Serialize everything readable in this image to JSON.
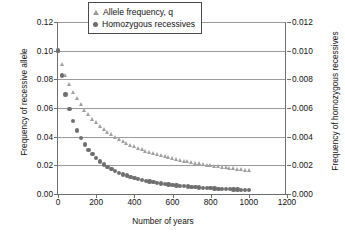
{
  "chart_data": {
    "type": "scatter",
    "title": "",
    "xlabel": "Number of years",
    "ylabel": "Frequency of recessive allele",
    "ylabel_right": "Frequency of homozygous recessives",
    "xlim": [
      0,
      1200
    ],
    "ylim": [
      0,
      0.12
    ],
    "ylim_right": [
      0,
      0.012
    ],
    "xticks": [
      0,
      200,
      400,
      600,
      800,
      1000,
      1200
    ],
    "xticklabels": [
      "0",
      "200",
      "400",
      "600",
      "800",
      "1000",
      "1200"
    ],
    "yticks": [
      0.0,
      0.02,
      0.04,
      0.06,
      0.08,
      0.1,
      0.12
    ],
    "yticklabels": [
      "0.00",
      "0.02",
      "0.04",
      "0.06",
      "0.08",
      "0.10",
      "0.12"
    ],
    "yticks_right": [
      0.0,
      0.002,
      0.004,
      0.006,
      0.008,
      0.01,
      0.012
    ],
    "yticklabels_right": [
      "0.000",
      "0.002",
      "0.004",
      "0.006",
      "0.008",
      "0.010",
      "0.012"
    ],
    "grid": true,
    "legend_position": "top-center",
    "series": [
      {
        "name": "Allele frequency, q",
        "marker": "triangle",
        "color": "#a0a0a0",
        "axis": "left",
        "x": [
          0,
          20,
          40,
          60,
          80,
          100,
          120,
          140,
          160,
          180,
          200,
          220,
          240,
          260,
          280,
          300,
          320,
          340,
          360,
          380,
          400,
          420,
          440,
          460,
          480,
          500,
          520,
          540,
          560,
          580,
          600,
          620,
          640,
          660,
          680,
          700,
          720,
          740,
          760,
          780,
          800,
          820,
          840,
          860,
          880,
          900,
          920,
          940,
          960,
          980,
          1000
        ],
        "y": [
          0.1,
          0.0909,
          0.0833,
          0.0769,
          0.0714,
          0.0667,
          0.0625,
          0.0588,
          0.0556,
          0.0526,
          0.05,
          0.0476,
          0.0455,
          0.0435,
          0.0417,
          0.04,
          0.0385,
          0.037,
          0.0357,
          0.0345,
          0.0333,
          0.0323,
          0.0313,
          0.0303,
          0.0294,
          0.0286,
          0.0278,
          0.027,
          0.0263,
          0.0256,
          0.025,
          0.0244,
          0.0238,
          0.0233,
          0.0228,
          0.0222,
          0.0217,
          0.0213,
          0.0208,
          0.0204,
          0.02,
          0.0196,
          0.0192,
          0.0189,
          0.0185,
          0.0182,
          0.0179,
          0.0175,
          0.0172,
          0.0169,
          0.0167
        ]
      },
      {
        "name": "Homozygous recessives",
        "marker": "circle",
        "color": "#6f6f6f",
        "axis": "right",
        "x": [
          0,
          20,
          40,
          60,
          80,
          100,
          120,
          140,
          160,
          180,
          200,
          220,
          240,
          260,
          280,
          300,
          320,
          340,
          360,
          380,
          400,
          420,
          440,
          460,
          480,
          500,
          520,
          540,
          560,
          580,
          600,
          620,
          640,
          660,
          680,
          700,
          720,
          740,
          760,
          780,
          800,
          820,
          840,
          860,
          880,
          900,
          920,
          940,
          960,
          980,
          1000
        ],
        "y": [
          0.01,
          0.00826,
          0.00694,
          0.00592,
          0.0051,
          0.00444,
          0.00391,
          0.00346,
          0.00309,
          0.00277,
          0.0025,
          0.00227,
          0.00207,
          0.00189,
          0.00174,
          0.0016,
          0.00148,
          0.00137,
          0.00128,
          0.00119,
          0.00111,
          0.00104,
          0.00098,
          0.00092,
          0.00087,
          0.00082,
          0.00077,
          0.00073,
          0.00069,
          0.00066,
          0.00063,
          0.0006,
          0.00057,
          0.00054,
          0.00052,
          0.00049,
          0.00047,
          0.00045,
          0.00043,
          0.00042,
          0.0004,
          0.00038,
          0.00037,
          0.00036,
          0.00034,
          0.00033,
          0.00032,
          0.00031,
          0.0003,
          0.00029,
          0.00028
        ]
      }
    ]
  },
  "legend": {
    "items": [
      {
        "label": "Allele frequency, q"
      },
      {
        "label": "Homozygous recessives"
      }
    ]
  }
}
